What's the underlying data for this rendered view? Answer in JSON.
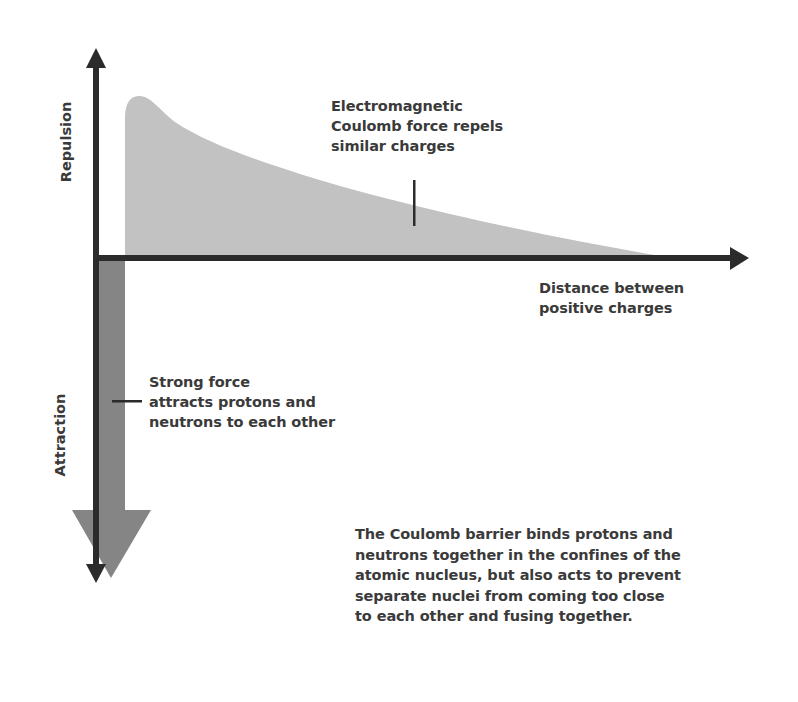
{
  "diagram": {
    "axes": {
      "y_positive_label": "Repulsion",
      "y_negative_label": "Attraction",
      "x_label_lines": [
        "Distance between",
        "positive charges"
      ]
    },
    "annotations": {
      "coulomb_lines": [
        "Electromagnetic",
        "Coulomb force repels",
        "similar charges"
      ],
      "strong_force_lines": [
        "Strong force",
        "attracts protons and",
        "neutrons to each other"
      ],
      "caption_lines": [
        "The Coulomb barrier binds protons and",
        "neutrons together in the confines of the",
        "atomic nucleus, but also acts to prevent",
        "separate nuclei from coming too close",
        "to each other and fusing together."
      ]
    },
    "colors": {
      "axis": "#2b2b2b",
      "coulomb_fill": "#c2c2c2",
      "strong_force_fill": "#858585",
      "text": "#3a3a3a",
      "background": "#ffffff"
    }
  }
}
